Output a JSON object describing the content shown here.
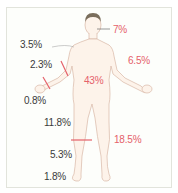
{
  "diagram": {
    "colors": {
      "accent": "#e5616a",
      "text": "#3a3a3a",
      "outline": "#d9b7a6",
      "skin": "#fdf3ea",
      "hair": "#7a6e5c"
    },
    "labels": {
      "head": "7%",
      "upper_arm": "3.5%",
      "forearm": "2.3%",
      "hand": "0.8%",
      "arm_total": "6.5%",
      "trunk": "43%",
      "thigh": "11.8%",
      "leg_total": "18.5%",
      "lower_leg": "5.3%",
      "foot": "1.8%"
    }
  }
}
